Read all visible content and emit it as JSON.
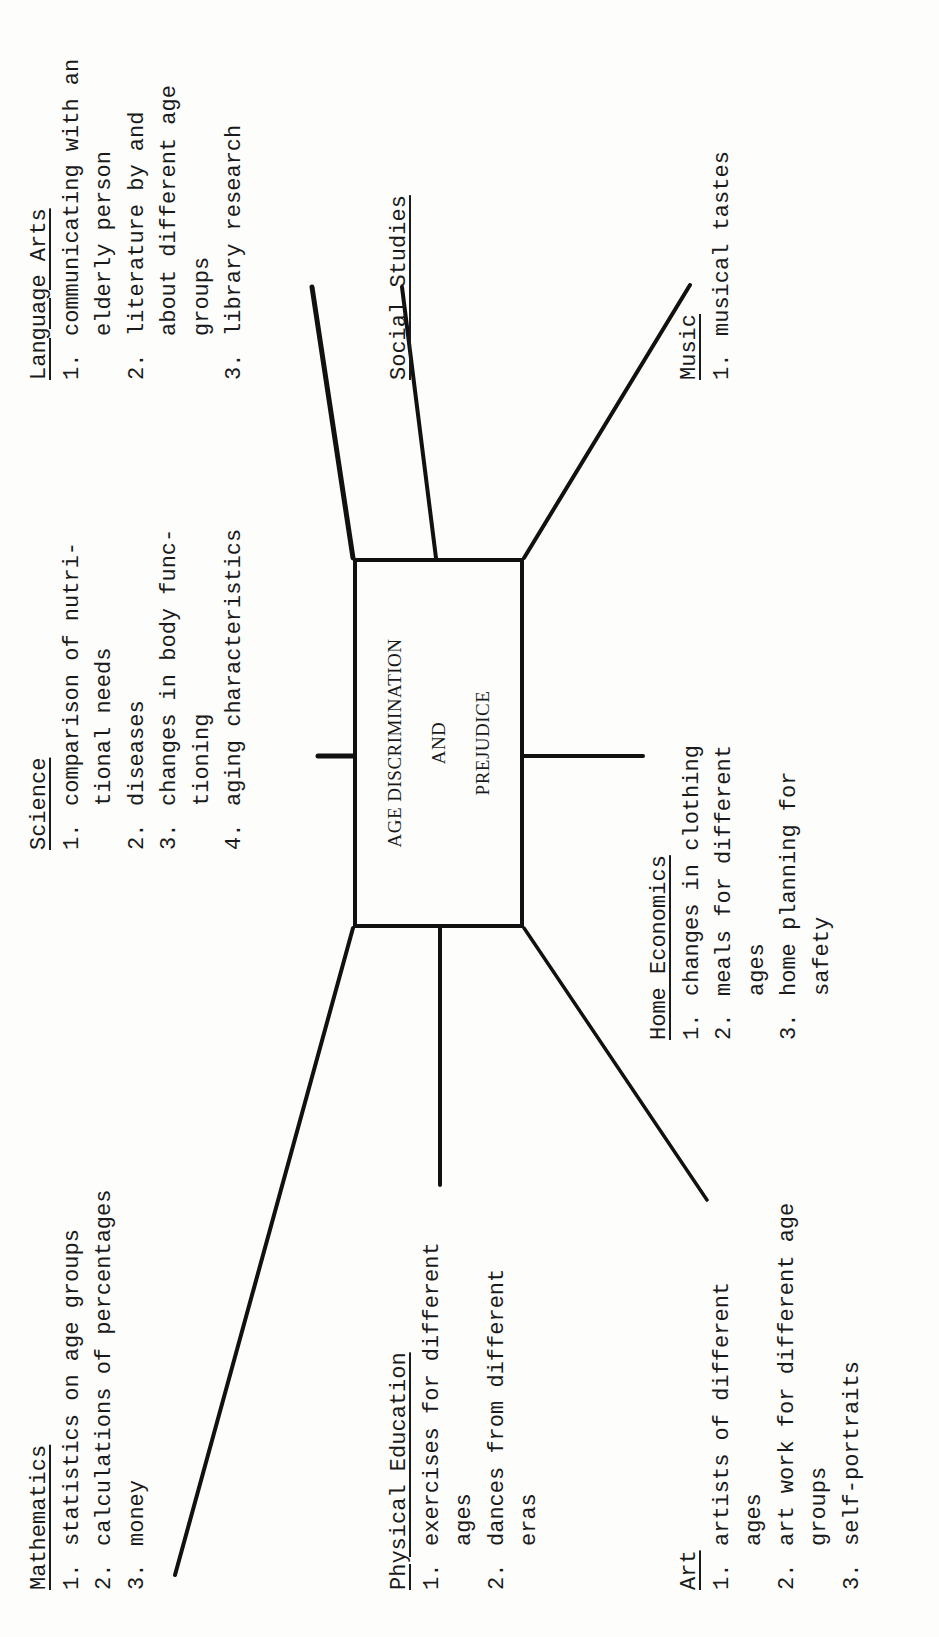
{
  "diagram": {
    "orientation": "rotated 90 degrees counter-clockwise",
    "center": {
      "lines": [
        "AGE DISCRIMINATION",
        "AND",
        "PREJUDICE"
      ]
    },
    "subjects": {
      "language_arts": {
        "heading": "Language Arts",
        "items": [
          {
            "num": "1.",
            "lines": [
              "communicating with an",
              "elderly person"
            ]
          },
          {
            "num": "2.",
            "lines": [
              "literature by and",
              "about different age",
              "groups"
            ]
          },
          {
            "num": "3.",
            "lines": [
              "library research"
            ]
          }
        ]
      },
      "social_studies": {
        "heading": "Social Studies",
        "items": []
      },
      "music": {
        "heading": "Music",
        "items": [
          {
            "num": "1.",
            "lines": [
              "musical tastes"
            ]
          }
        ]
      },
      "science": {
        "heading": "Science",
        "items": [
          {
            "num": "1.",
            "lines": [
              "comparison of nutri-",
              "tional needs"
            ]
          },
          {
            "num": "2.",
            "lines": [
              "diseases"
            ]
          },
          {
            "num": "3.",
            "lines": [
              "changes in body func-",
              "tioning"
            ]
          },
          {
            "num": "4.",
            "lines": [
              "aging characteristics"
            ]
          }
        ]
      },
      "home_economics": {
        "heading": "Home Economics",
        "items": [
          {
            "num": "1.",
            "lines": [
              "changes in clothing"
            ]
          },
          {
            "num": "2.",
            "lines": [
              "meals for different",
              "ages"
            ]
          },
          {
            "num": "3.",
            "lines": [
              "home planning for",
              "safety"
            ]
          }
        ]
      },
      "mathematics": {
        "heading": "Mathematics",
        "items": [
          {
            "num": "1.",
            "lines": [
              "statistics on age groups"
            ]
          },
          {
            "num": "2.",
            "lines": [
              "calculations of percentages"
            ]
          },
          {
            "num": "3.",
            "lines": [
              "money"
            ]
          }
        ]
      },
      "physical_education": {
        "heading": "Physical Education",
        "items": [
          {
            "num": "1.",
            "lines": [
              "exercises for different",
              "ages"
            ]
          },
          {
            "num": "2.",
            "lines": [
              "dances from different",
              "eras"
            ]
          }
        ]
      },
      "art": {
        "heading": "Art",
        "items": [
          {
            "num": "1.",
            "lines": [
              "artists of different",
              "ages"
            ]
          },
          {
            "num": "2.",
            "lines": [
              "art work for different age",
              "groups"
            ]
          },
          {
            "num": "3.",
            "lines": [
              "self-portraits"
            ]
          }
        ]
      }
    },
    "colors": {
      "ink": "#1a1a1a",
      "paper": "#fdfdfc"
    }
  }
}
